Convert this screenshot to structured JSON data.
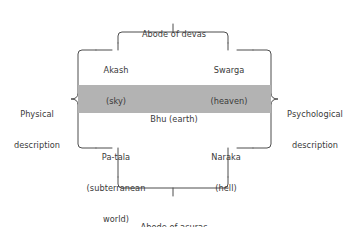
{
  "diagram": {
    "title_top": "Abode of devas",
    "title_bottom": "Abode of asuras",
    "left_caption": {
      "line1": "Physical",
      "line2": "description"
    },
    "right_caption": {
      "line1": "Psychological",
      "line2": "description"
    },
    "center_band": {
      "label": "Bhu (earth)",
      "fill_color": "#b3b3b3"
    },
    "quadrants": [
      {
        "name": "akash",
        "line1": "Akash",
        "line2": "(sky)",
        "line3": ""
      },
      {
        "name": "swarga",
        "line1": "Swarga",
        "line2": "(heaven)",
        "line3": ""
      },
      {
        "name": "patala",
        "line1": "Pa-tala",
        "line2": "(subterranean",
        "line3": "world)"
      },
      {
        "name": "naraka",
        "line1": "Naraka",
        "line2": "(hell)",
        "line3": ""
      }
    ],
    "colors": {
      "line": "#4d4d4d",
      "text": "#3a3a3a",
      "band": "#b3b3b3",
      "background": "#ffffff"
    }
  }
}
